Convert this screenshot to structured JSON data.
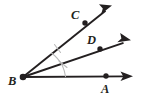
{
  "figure": {
    "background_color": "#ffffff",
    "stroke_color": "#231f20",
    "mark_color": "#b9b9b9",
    "width": 141,
    "height": 99
  },
  "labels": {
    "vertex": "B",
    "upper_ray_point": "C",
    "middle_ray_point": "D",
    "lower_ray_point": "A"
  },
  "points": {
    "B": {
      "name": "B",
      "x": 23,
      "y": 77
    },
    "C": {
      "name": "C",
      "x": 85,
      "y": 23
    },
    "D": {
      "name": "D",
      "x": 100,
      "y": 49
    },
    "A": {
      "name": "A",
      "x": 106,
      "y": 76
    }
  },
  "label_positions": {
    "B": {
      "x": 8,
      "y": 85
    },
    "C": {
      "x": 71,
      "y": 19
    },
    "D": {
      "x": 87,
      "y": 44
    },
    "A": {
      "x": 101,
      "y": 93
    }
  },
  "rays": [
    {
      "name": "ray-bc",
      "from": "B",
      "through": "C",
      "tip_x": 112,
      "tip_y": 5,
      "arrow_angle_deg": -41
    },
    {
      "name": "ray-bd",
      "from": "B",
      "through": "D",
      "tip_x": 131,
      "tip_y": 40,
      "arrow_angle_deg": -20
    },
    {
      "name": "ray-ba",
      "from": "B",
      "through": "A",
      "tip_x": 133,
      "tip_y": 76,
      "arrow_angle_deg": 0
    }
  ],
  "angle_marks": [
    {
      "name": "angle-cbd-arc",
      "between": "BC and BD",
      "tick_count": 1,
      "tick_x": 58,
      "tick_y": 48
    },
    {
      "name": "angle-dba-arc",
      "between": "BD and BA",
      "tick_count": 1,
      "tick_x": 63,
      "tick_y": 64
    }
  ]
}
